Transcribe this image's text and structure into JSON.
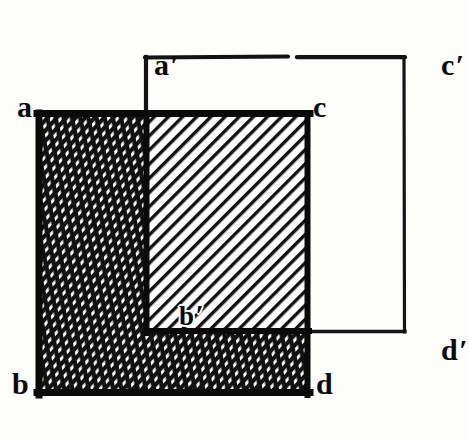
{
  "figure": {
    "kind": "geometry-diagram",
    "ink_color": "#0a0a0a",
    "paper_color": "#fdfdfc",
    "squares": [
      {
        "name": "square-abcd",
        "style": "solid-outline-shaded",
        "x": 37,
        "y": 113,
        "width": 273,
        "height": 282,
        "corner_labels": [
          "a",
          "c",
          "b",
          "d"
        ]
      },
      {
        "name": "square-a-prime-b-prime-c-prime-d-prime",
        "style": "thin-outline",
        "x": 145,
        "y": 57,
        "width": 260,
        "height": 275,
        "corner_labels": [
          "a'",
          "c'",
          "b'",
          "d'"
        ]
      }
    ],
    "regions": [
      {
        "name": "overlap-region",
        "fill": "single-diagonal-hatch",
        "x": 145,
        "y": 113,
        "width": 165,
        "height": 219
      },
      {
        "name": "left-strip-region",
        "fill": "dense-cross-hatch",
        "x": 37,
        "y": 113,
        "width": 108,
        "height": 282
      },
      {
        "name": "bottom-band-region",
        "fill": "dense-cross-hatch",
        "x": 145,
        "y": 332,
        "width": 165,
        "height": 63
      }
    ],
    "labels": {
      "a": "a",
      "b": "b",
      "c": "c",
      "d": "d",
      "a_prime_base": "a",
      "a_prime_mark": "′",
      "b_prime_base": "b",
      "b_prime_mark": "′",
      "c_prime_base": "c",
      "c_prime_mark": "′",
      "d_prime_base": "d",
      "d_prime_mark": "′"
    }
  }
}
